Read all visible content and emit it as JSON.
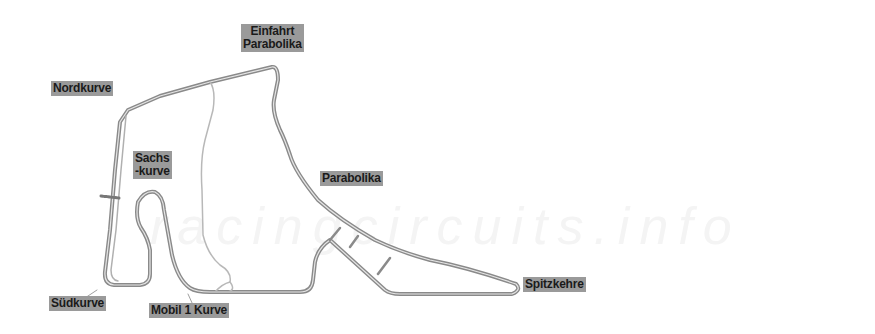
{
  "map": {
    "title": "Hockenheimring circuit map",
    "watermark": "racingcircuits.info",
    "colors": {
      "track": "#888888",
      "track_inner": "#cfcfcf",
      "label_bg": "#9a9a9a",
      "label_text": "#1a1a1a",
      "watermark": "#f4f4f4"
    },
    "labels": {
      "einfahrt": {
        "line1": "Einfahrt",
        "line2": "Parabolika"
      },
      "nordkurve": "Nordkurve",
      "sachs": {
        "line1": "Sachs",
        "line2": "-kurve"
      },
      "parabolika": "Parabolika",
      "spitzkehre": "Spitzkehre",
      "sudkurve": "Südkurve",
      "mobil": "Mobil 1 Kurve"
    }
  }
}
